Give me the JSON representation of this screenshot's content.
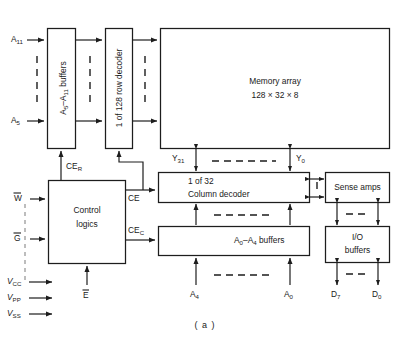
{
  "figure": {
    "caption": "( a )",
    "colors": {
      "ink": "#1d1d1d",
      "pin_dash": "#9a9a9a",
      "background": "#ffffff"
    }
  },
  "blocks": {
    "row_buffers": {
      "label": "A",
      "sub1": "5",
      "dash": "–A",
      "sub2": "11",
      "tail": " buffers",
      "full": "A5–A11 buffers",
      "orientation": "vertical"
    },
    "row_decoder": {
      "label": "1 of 128 row decoder",
      "orientation": "vertical"
    },
    "memory_array": {
      "line1": "Memory array",
      "line2": "128 × 32 × 8"
    },
    "column_decoder": {
      "line1": "1 of 32",
      "line2": "Column decoder"
    },
    "sense_amps": {
      "label": "Sense amps"
    },
    "io_buffers": {
      "line1": "I/O",
      "line2": "buffers"
    },
    "col_buffers": {
      "label": "A",
      "sub1": "0",
      "dash": "–A",
      "sub2": "4",
      "tail": "  buffers",
      "full": "A0–A4 buffers"
    },
    "control_logic": {
      "line1": "Control",
      "line2": "logics"
    }
  },
  "signals": {
    "addr_high_top": {
      "base": "A",
      "sub": "11"
    },
    "addr_high_bot": {
      "base": "A",
      "sub": "5"
    },
    "addr_low_left": {
      "base": "A",
      "sub": "4"
    },
    "addr_low_right": {
      "base": "A",
      "sub": "0"
    },
    "y_left": {
      "base": "Y",
      "sub": "31"
    },
    "y_right": {
      "base": "Y",
      "sub": "0"
    },
    "data_left": {
      "base": "D",
      "sub": "7"
    },
    "data_right": {
      "base": "D",
      "sub": "0"
    },
    "ce_row": {
      "base": "CE",
      "sub": "R"
    },
    "ce": {
      "base": "CE",
      "sub": ""
    },
    "ce_col": {
      "base": "CE",
      "sub": "C"
    },
    "write_enable": {
      "base": "W",
      "overbar": true
    },
    "output_enable": {
      "base": "G",
      "overbar": true
    },
    "chip_enable": {
      "base": "E",
      "overbar": true
    },
    "vcc": {
      "base": "V",
      "sub": "CC"
    },
    "vpp": {
      "base": "V",
      "sub": "PP"
    },
    "vss": {
      "base": "V",
      "sub": "SS"
    }
  }
}
